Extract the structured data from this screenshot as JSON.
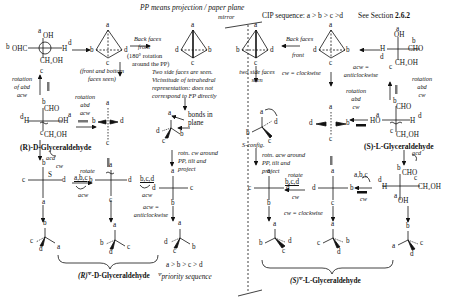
{
  "header": {
    "pp_note": "PP means projection / paper plane",
    "mirror": "mirror",
    "cip": "CIP sequence:  a > b > c >d",
    "see_section_prefix": "See Section ",
    "see_section_num": "2.6.2"
  },
  "left": {
    "fischer1": {
      "a": "a",
      "oh": "OH",
      "b": "b",
      "ohc": "OHC",
      "h": "H",
      "d": "d",
      "ch2oh": "CH₂OH",
      "c": "c"
    },
    "tetra1": {
      "a": "a",
      "b": "b",
      "c": "c",
      "d": "d",
      "caption1": "(front and bottom",
      "caption2": "faces seen)"
    },
    "arrow_back": {
      "l1": "Back faces",
      "l2": "front",
      "l3": "(180° rotation",
      "l4": "around the PP)"
    },
    "tetra2": {
      "a": "a",
      "b": "b",
      "c": "c",
      "d": "d"
    },
    "side_note": [
      "Two side faces are seen.",
      "Vicissitude of tetrahedral",
      "representation: does not",
      "correspond to FP directly"
    ],
    "rot_abd_acw_left": [
      "rotation",
      "of abd",
      "acw"
    ],
    "rot_abd_acw_mid": [
      "rotation",
      "abd",
      "acw"
    ],
    "fischer2": {
      "b": "b",
      "cho": "CHO",
      "d": "d",
      "h": "H",
      "oh": "OH",
      "a": "a",
      "c": "c",
      "ch2oh": "CH₂OH"
    },
    "name_R": "(R)-D-Glyceraldehyde",
    "acd_cw": [
      "acd",
      "cw"
    ],
    "tetra3": {
      "a": "a",
      "b": "b",
      "c": "c",
      "d": "d"
    },
    "bonds_in_plane": [
      "bonds in",
      "plane"
    ],
    "persp1": {
      "a": "a",
      "b": "b",
      "c": "c",
      "d": "d"
    },
    "rotn_cw": [
      "rotn. cw around",
      "PP, tilt and",
      "project"
    ],
    "fischer3": {
      "b": "b",
      "c": "c",
      "s": "S",
      "d": "d",
      "a": "a"
    },
    "rotate_abc": {
      "rotate": "rotate",
      "letters": "a,b,c",
      "dir": "acw"
    },
    "fischer4": {
      "a": "a",
      "b": "b",
      "d": "d",
      "c": "c"
    },
    "rotate_bcd": {
      "letters": "b,c,d",
      "dir": "acw"
    },
    "acw_def": [
      "acw =",
      "anticlockwise"
    ],
    "fischer5": {
      "a": "a",
      "d": "d",
      "c": "c",
      "b": "b"
    },
    "persp_bottom": [
      {
        "top": "b",
        "l": "c",
        "bot": "d",
        "r": "a"
      },
      {
        "top": "a",
        "l": "b",
        "bot": "d",
        "r": "c"
      },
      {
        "top": "a",
        "l": "d",
        "bot": "c",
        "r": "b"
      }
    ],
    "priority_line": "a > b > c > d",
    "priority_label": "priority sequence",
    "psi": "Ψ",
    "name_R_psi": "(R)",
    "name_R_rest": "-D-Glyceraldehyde"
  },
  "right": {
    "tetra_r1": {
      "a": "a",
      "b": "b",
      "c": "c",
      "d": "d",
      "caption1": "two side faces",
      "caption2": "seen"
    },
    "arrow_back": {
      "l1": "Back faces",
      "l2": "front"
    },
    "cw_def": "cw = clockwise",
    "tetra_r2": {
      "a": "a",
      "b": "b",
      "c": "c",
      "d": "d"
    },
    "acw_def": [
      "acw =",
      "anticlockwise"
    ],
    "fischer_r1": {
      "a": "a",
      "oh": "OH",
      "b": "b",
      "h": "H",
      "cho": "CHO",
      "d": "d",
      "ch2oh": "CH₂OH",
      "c": "c"
    },
    "rot_abd_cw": [
      "rotation",
      "abd",
      "cw"
    ],
    "rot_abd_cw_mid": [
      "rotation",
      "abd",
      "cw"
    ],
    "persp_r": {
      "a": "a",
      "b": "b",
      "c": "c",
      "d": "d",
      "label": "S-config."
    },
    "rotn_acw": [
      "rotn. acw around",
      "PP, tilt and",
      "project"
    ],
    "fischer_r2": {
      "a": "a",
      "d": "d",
      "c": "c",
      "b": "b"
    },
    "tetra_flat": {
      "a": "a",
      "b": "b",
      "c": "c",
      "d": "d"
    },
    "fischer_r3": {
      "b": "b",
      "cho": "CHO",
      "a": "a",
      "ho": "HO",
      "h": "H",
      "d": "d",
      "c": "c",
      "ch2oh": "CH₂OH"
    },
    "name_S": "(S)-L-Glyceraldehyde",
    "acd": "acd",
    "fischer_r4": {
      "b": "b",
      "cho": "CHO",
      "c": "c",
      "d": "d",
      "h": "H",
      "ch2oh": "CH₂OH",
      "a": "a",
      "oh": "OH"
    },
    "rotate_bcd": {
      "rotate": "rotate",
      "letters": "b,c,d",
      "dir": "cw"
    },
    "fischer_r5": {
      "a": "a",
      "c": "c",
      "d": "d",
      "b": "b"
    },
    "rotate_abc": {
      "letters": "a,b,c",
      "dir": "cw"
    },
    "fischer_r6": {
      "a": "a",
      "d": "d",
      "c": "c",
      "b": "b"
    },
    "persp_bottom": [
      {
        "top": "a",
        "l": "b",
        "bot": "c",
        "r": "d"
      },
      {
        "top": "a",
        "l": "c",
        "bot": "d",
        "r": "b"
      },
      {
        "top": "b",
        "l": "a",
        "bot": "d",
        "r": "c"
      }
    ],
    "name_S_psi": "(S)",
    "name_S_rest": "-L-Glyceraldehyde"
  }
}
